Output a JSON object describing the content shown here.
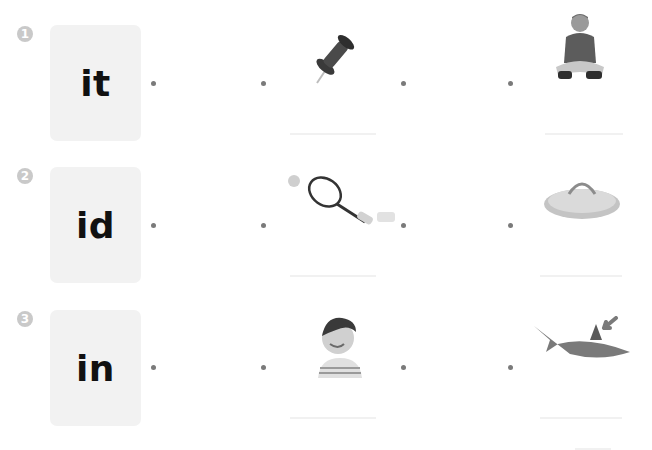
{
  "exercise": {
    "rows": [
      {
        "number": "1",
        "word": "it",
        "picture_left": "push-pin",
        "picture_right": "boy-sitting"
      },
      {
        "number": "2",
        "word": "id",
        "picture_left": "tennis-racket",
        "picture_right": "pot-lid"
      },
      {
        "number": "3",
        "word": "in",
        "picture_left": "kid-grinning",
        "picture_right": "shark-fin"
      }
    ]
  },
  "colors": {
    "card_bg": "#f2f2f2",
    "number_badge": "#c9c9c9",
    "dot": "#7a7a7a",
    "word_text": "#111111"
  }
}
